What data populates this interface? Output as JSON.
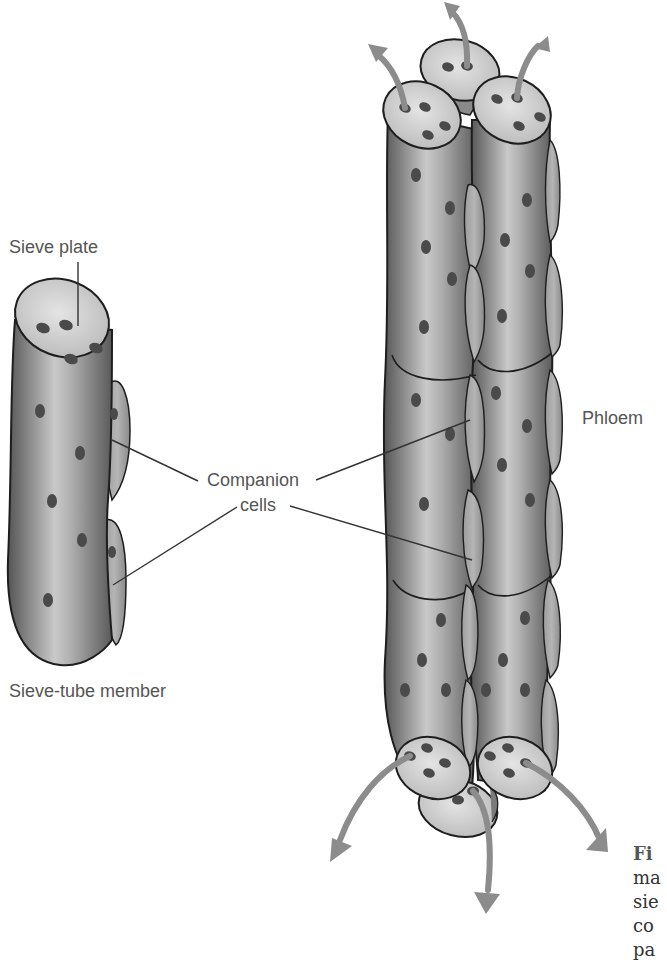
{
  "figure": {
    "labels": {
      "sieve_plate": "Sieve plate",
      "companion_cells_line1": "Companion",
      "companion_cells_line2": "cells",
      "sieve_tube_member": "Sieve-tube member",
      "phloem": "Phloem"
    },
    "caption_fragment": {
      "line1": "Fi",
      "line2": "ma",
      "line3": "sie",
      "line4": "co",
      "line5": "pa"
    },
    "colors": {
      "tube_dark": "#5e5e5e",
      "tube_mid": "#9a9a9a",
      "tube_light": "#c8c8c8",
      "plate": "#d6d6d6",
      "pore": "#4a4a4a",
      "companion": "#a9a9a9",
      "arrow": "#8c8c8c",
      "outline": "#1e1e1e",
      "label_text": "#555555"
    }
  }
}
